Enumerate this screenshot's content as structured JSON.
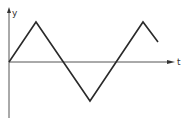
{
  "diagram": {
    "type": "triangle-wave",
    "axes": {
      "x_label": "t",
      "y_label": "y"
    },
    "colors": {
      "line": "#2a2a2a",
      "axis": "#555555"
    },
    "waveform_points": [
      [
        9,
        62
      ],
      [
        36,
        22
      ],
      [
        90,
        101
      ],
      [
        143,
        22
      ],
      [
        158,
        42
      ]
    ]
  },
  "chart_data": {
    "type": "line",
    "title": "",
    "xlabel": "t",
    "ylabel": "y",
    "x": [
      0,
      1,
      3,
      5,
      5.55
    ],
    "values": [
      0,
      1,
      -1,
      1,
      0.5
    ],
    "grid": false,
    "legend": "none"
  }
}
